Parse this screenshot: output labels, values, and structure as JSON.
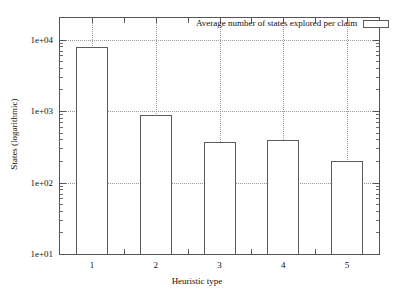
{
  "chart_data": {
    "type": "bar",
    "title": "",
    "xlabel": "Heuristic type",
    "ylabel": "States (logarithmic)",
    "categories": [
      "1",
      "2",
      "3",
      "4",
      "5"
    ],
    "values": [
      7800,
      870,
      370,
      390,
      200
    ],
    "series": [
      {
        "name": "Average number of states explored per claim",
        "values": [
          7800,
          870,
          370,
          390,
          200
        ]
      }
    ],
    "yscale": "log",
    "ylim": [
      10,
      20000
    ],
    "ytick_labels": [
      "1e+04",
      "1e+03",
      "1e+02",
      "1e+01"
    ],
    "ytick_values": [
      10000,
      1000,
      100,
      10
    ],
    "xtick_labels": [
      "1",
      "2",
      "3",
      "4",
      "5"
    ],
    "grid": true,
    "legend": {
      "position": "top-right",
      "entries": [
        "Average number of states explored per claim"
      ]
    },
    "colors": {
      "bar_fill": "#ffffff",
      "bar_border": "#5b5b5b",
      "frame": "#555555",
      "grid": "#9a9a9a",
      "text": "#111111",
      "background": "#ffffff"
    }
  },
  "axis": {
    "y_title": "States (logarithmic)",
    "x_title": "Heuristic type",
    "y_ticks": [
      {
        "label": "1e+04"
      },
      {
        "label": "1e+03"
      },
      {
        "label": "1e+02"
      },
      {
        "label": "1e+01"
      }
    ],
    "x_ticks": [
      {
        "label": "1"
      },
      {
        "label": "2"
      },
      {
        "label": "3"
      },
      {
        "label": "4"
      },
      {
        "label": "5"
      }
    ]
  },
  "legend": {
    "label": "Average number of states explored per claim"
  }
}
